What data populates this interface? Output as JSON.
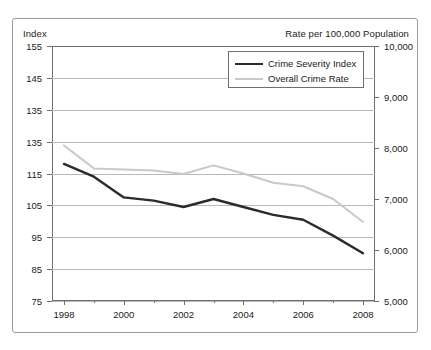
{
  "figure": {
    "left_axis_title": "Index",
    "right_axis_title": "Rate per 100,000 Population"
  },
  "legend": {
    "items": [
      {
        "label": "Crime Severity Index",
        "color": "#2b2b2b"
      },
      {
        "label": "Overall Crime Rate",
        "color": "#c9c9c9"
      }
    ]
  },
  "chart_data": {
    "type": "line",
    "title": "",
    "subtitle": "",
    "xlabel": "",
    "ylabel": "Index",
    "y2label": "Rate per 100,000 Population",
    "grid": true,
    "legend_position": "top-right-inside",
    "x": [
      1998,
      1999,
      2000,
      2001,
      2002,
      2003,
      2004,
      2005,
      2006,
      2007,
      2008
    ],
    "xlim": [
      1997.6,
      2008.4
    ],
    "xtick_labels": [
      "1998",
      "2000",
      "2002",
      "2004",
      "2006",
      "2008"
    ],
    "xticks_major": [
      1998,
      2000,
      2002,
      2004,
      2006,
      2008
    ],
    "xticks_minor": [
      1999,
      2001,
      2003,
      2005,
      2007
    ],
    "ylim": [
      75,
      155
    ],
    "ytick_labels": [
      "155",
      "145",
      "135",
      "135",
      "115",
      "105",
      "95",
      "85",
      "75"
    ],
    "yticks": [
      155,
      145,
      135,
      125,
      115,
      105,
      95,
      85,
      75
    ],
    "ylim2": [
      5000,
      10000
    ],
    "ytick2_labels": [
      "10,000",
      "9,000",
      "8,000",
      "7,000",
      "6,000",
      "5,000"
    ],
    "yticks2": [
      10000,
      9000,
      8000,
      7000,
      6000,
      5000
    ],
    "series": [
      {
        "name": "Crime Severity Index",
        "axis": "left",
        "color": "#2b2b2b",
        "values": [
          118.0,
          114.0,
          107.5,
          106.5,
          104.5,
          107.0,
          104.5,
          102.0,
          100.5,
          95.5,
          90.0
        ]
      },
      {
        "name": "Overall Crime Rate",
        "axis": "right",
        "color": "#c9c9c9",
        "values": [
          8050,
          7600,
          7580,
          7560,
          7490,
          7660,
          7500,
          7320,
          7250,
          7000,
          6550
        ]
      }
    ]
  }
}
